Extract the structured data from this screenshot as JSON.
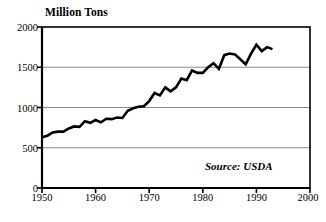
{
  "chart_data": {
    "type": "line",
    "title": "Million Tons",
    "xlabel": "",
    "ylabel": "Million Tons",
    "xlim": [
      1950,
      2000
    ],
    "ylim": [
      0,
      2000
    ],
    "yticks": [
      0,
      500,
      1000,
      1500,
      2000
    ],
    "xticks": [
      1950,
      1960,
      1970,
      1980,
      1990,
      2000
    ],
    "grid": true,
    "gridlines_at": [
      500,
      1000,
      1500
    ],
    "legend": "none",
    "annotations": [
      {
        "text": "Source: USDA",
        "position": "bottom-right",
        "style": "italic"
      }
    ],
    "series": [
      {
        "name": "World Grain Production",
        "color": "#000000",
        "x": [
          1950,
          1951,
          1952,
          1953,
          1954,
          1955,
          1956,
          1957,
          1958,
          1959,
          1960,
          1961,
          1962,
          1963,
          1964,
          1965,
          1966,
          1967,
          1968,
          1969,
          1970,
          1971,
          1972,
          1973,
          1974,
          1975,
          1976,
          1977,
          1978,
          1979,
          1980,
          1981,
          1982,
          1983,
          1984,
          1985,
          1986,
          1987,
          1988,
          1989,
          1990,
          1991,
          1992,
          1993
        ],
        "values": [
          631,
          650,
          690,
          700,
          700,
          740,
          765,
          760,
          830,
          810,
          845,
          815,
          860,
          855,
          875,
          870,
          960,
          990,
          1010,
          1015,
          1080,
          1180,
          1150,
          1250,
          1200,
          1250,
          1360,
          1340,
          1460,
          1430,
          1430,
          1500,
          1550,
          1480,
          1650,
          1670,
          1660,
          1600,
          1535,
          1670,
          1780,
          1700,
          1750,
          1725
        ]
      }
    ]
  },
  "ytick_labels": [
    "0",
    "500",
    "1000",
    "1500",
    "2000"
  ],
  "xtick_labels": [
    "1950",
    "1960",
    "1970",
    "1980",
    "1990",
    "2000"
  ],
  "source_label": "Source: USDA",
  "colors": {
    "line": "#000000",
    "axis": "#000000",
    "grid": "#8a8a8a",
    "background": "#ffffff"
  }
}
